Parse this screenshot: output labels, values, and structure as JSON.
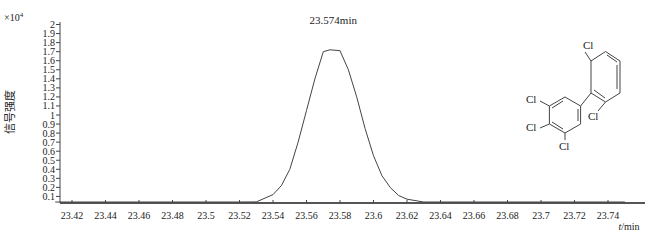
{
  "chart_data": {
    "type": "line",
    "title": "",
    "peak_label": "23.574min",
    "xlabel": "t/min",
    "xlabel_italic": "t",
    "xlabel_unit": "/min",
    "ylabel": "信号强度",
    "y_multiplier": "×10",
    "y_multiplier_exp": "4",
    "xlim": [
      23.41,
      23.75
    ],
    "ylim": [
      0,
      2.05
    ],
    "x_ticks": [
      "23.42",
      "23.44",
      "23.46",
      "23.48",
      "23.5",
      "23.52",
      "23.54",
      "23.56",
      "23.58",
      "23.6",
      "23.62",
      "23.64",
      "23.66",
      "23.68",
      "23.7",
      "23.72",
      "23.74"
    ],
    "y_ticks": [
      "0.1",
      "0.2",
      "0.3",
      "0.4",
      "0.5",
      "0.6",
      "0.7",
      "0.8",
      "0.9",
      "1",
      "1.1",
      "1.2",
      "1.3",
      "1.4",
      "1.5",
      "1.6",
      "1.7",
      "1.8",
      "1.9",
      "2"
    ],
    "series": [
      {
        "name": "chromatogram",
        "x": [
          23.41,
          23.5,
          23.52,
          23.53,
          23.54,
          23.545,
          23.55,
          23.555,
          23.56,
          23.565,
          23.57,
          23.574,
          23.58,
          23.585,
          23.59,
          23.595,
          23.6,
          23.605,
          23.61,
          23.615,
          23.62,
          23.63,
          23.64,
          23.66,
          23.75
        ],
        "values": [
          0,
          0,
          0.005,
          0.04,
          0.12,
          0.22,
          0.4,
          0.7,
          1.05,
          1.4,
          1.7,
          1.72,
          1.71,
          1.5,
          1.2,
          0.85,
          0.55,
          0.33,
          0.2,
          0.11,
          0.07,
          0.03,
          0.01,
          0,
          0
        ]
      }
    ],
    "grid": false,
    "legend": "none",
    "annotations": [
      "23.574min"
    ],
    "structure_labels": [
      "Cl",
      "Cl",
      "Cl",
      "Cl",
      "Cl"
    ]
  }
}
